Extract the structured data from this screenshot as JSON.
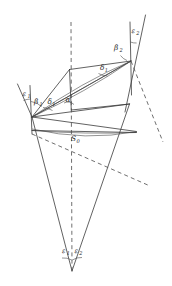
{
  "figure": {
    "type": "geometry-diagram",
    "background_color": "#ffffff",
    "line_color": "#3a3a3a",
    "dashed_line_color": "#4a4a4a",
    "labels": [
      {
        "id": "eps1-left",
        "base": "ε",
        "sub": "1",
        "x": 22.5,
        "y": 96.0
      },
      {
        "id": "beta1",
        "base": "β",
        "sub": "1",
        "x": 34.0,
        "y": 103.5
      },
      {
        "id": "delta1-left",
        "base": "δ",
        "sub": "1",
        "x": 47.5,
        "y": 104.0
      },
      {
        "id": "alpha",
        "base": "α",
        "sub": "",
        "x": 68.0,
        "y": 101.5
      },
      {
        "id": "delta1-right",
        "base": "δ",
        "sub": "1",
        "x": 102.0,
        "y": 70.0
      },
      {
        "id": "beta2",
        "base": "β",
        "sub": "2",
        "x": 119.0,
        "y": 51.0
      },
      {
        "id": "eps2-top",
        "base": "ε",
        "sub": "2",
        "x": 135.0,
        "y": 32.0
      },
      {
        "id": "S0",
        "base": "S",
        "sub": "0",
        "x": 74.0,
        "y": 140.0
      },
      {
        "id": "eps1-bottom",
        "base": "ε",
        "sub": "1",
        "x": 63.5,
        "y": 252.0
      },
      {
        "id": "eps2-bottom",
        "base": "ε",
        "sub": "2",
        "x": 76.0,
        "y": 252.0
      }
    ],
    "vertices": {
      "left_apex": {
        "x": 32.0,
        "y": 117.0
      },
      "right_apex": {
        "x": 131.0,
        "y": 61.0
      },
      "bottom_apex": {
        "x": 72.0,
        "y": 271.0
      },
      "center_node": {
        "x": 72.0,
        "y": 133.0
      }
    }
  }
}
